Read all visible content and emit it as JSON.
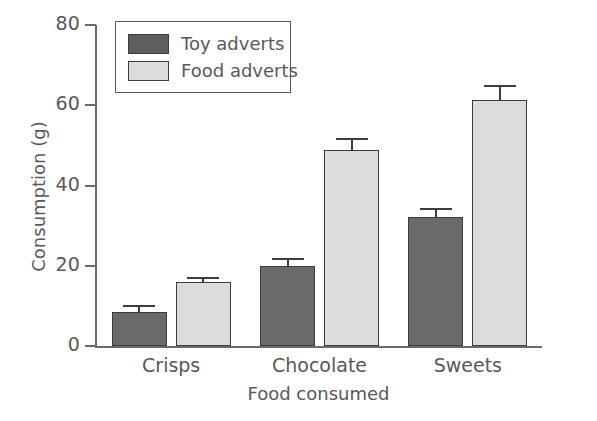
{
  "chart_data": {
    "type": "bar",
    "title": "",
    "xlabel": "Food consumed",
    "ylabel": "Consumption (g)",
    "categories": [
      "Crisps",
      "Chocolate",
      "Sweets"
    ],
    "ylim": [
      0,
      80
    ],
    "yticks": [
      0,
      20,
      40,
      60,
      80
    ],
    "grid": false,
    "legend_position": "top-left",
    "series": [
      {
        "name": "Toy adverts",
        "color": "#6a6a6a",
        "values": [
          8.4,
          20.0,
          32.2
        ],
        "errors": [
          1.7,
          2.0,
          2.2
        ]
      },
      {
        "name": "Food adverts",
        "color": "#dcdcdc",
        "values": [
          15.9,
          48.9,
          61.2
        ],
        "errors": [
          1.2,
          3.0,
          3.9
        ]
      }
    ]
  },
  "axis": {
    "y_title": "Consumption (g)",
    "x_title": "Food consumed",
    "y_tick_labels": [
      "0",
      "20",
      "40",
      "60",
      "80"
    ],
    "x_tick_labels": [
      "Crisps",
      "Chocolate",
      "Sweets"
    ]
  },
  "legend": {
    "entries": [
      {
        "label": "Toy adverts",
        "swatch": "dark"
      },
      {
        "label": "Food adverts",
        "swatch": "light"
      }
    ]
  }
}
